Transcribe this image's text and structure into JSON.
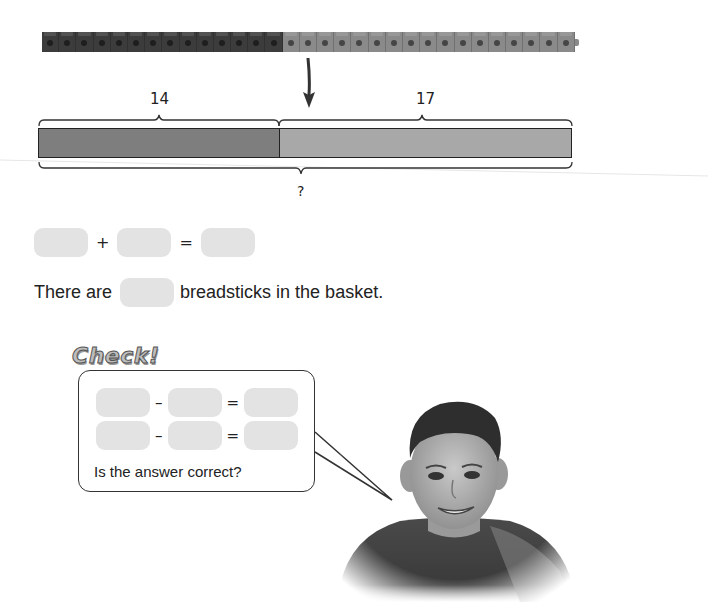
{
  "cube_train": {
    "dark_count": 14,
    "light_count": 17,
    "dark_color": "#3c3c3c",
    "light_color": "#8a8a8a"
  },
  "bar_model": {
    "part1_label": "14",
    "part2_label": "17",
    "whole_label": "?",
    "part1_color": "#7e7e7e",
    "part2_color": "#a8a8a8"
  },
  "addition_equation": {
    "operator": "+",
    "equals": "="
  },
  "sentence": {
    "before": "There are",
    "after": "breadsticks in the basket."
  },
  "check": {
    "title": "Check!",
    "row1": {
      "operator": "–",
      "equals": "="
    },
    "row2": {
      "operator": "–",
      "equals": "="
    },
    "question": "Is the answer correct?"
  },
  "illustration": {
    "subject": "smiling boy photo"
  }
}
